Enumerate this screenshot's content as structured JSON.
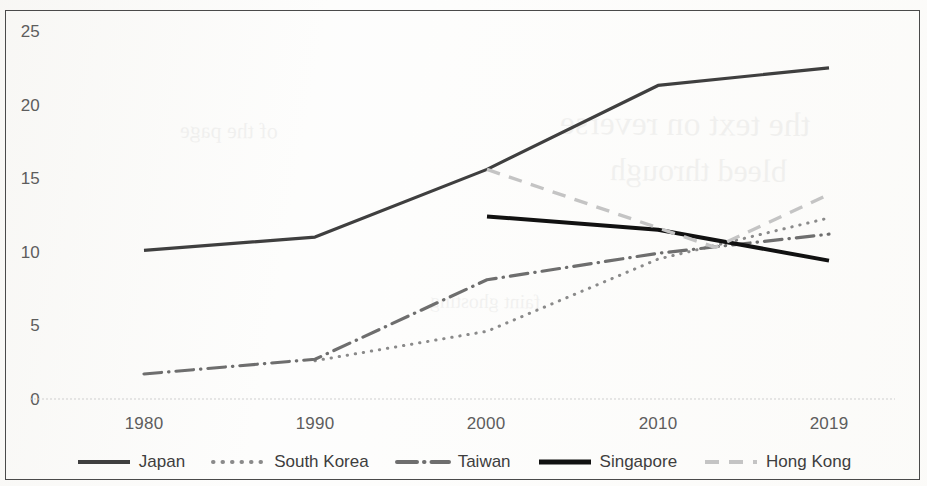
{
  "chart_data": {
    "type": "line",
    "title": "",
    "xlabel": "",
    "ylabel": "",
    "x": [
      1980,
      1990,
      2000,
      2010,
      2019
    ],
    "categories": [
      "1980",
      "1990",
      "2000",
      "2010",
      "2019"
    ],
    "x_tick_labels": [
      "1980",
      "1990",
      "2000",
      "2010",
      "2019"
    ],
    "y_tick_labels": [
      "0",
      "5",
      "10",
      "15",
      "20",
      "25"
    ],
    "y_ticks": [
      0,
      5,
      10,
      15,
      20,
      25
    ],
    "ylim": [
      0,
      25
    ],
    "grid": false,
    "legend_position": "bottom",
    "series": [
      {
        "name": "Japan",
        "style": "solid",
        "color": "#3f3f3f",
        "width": 3.2,
        "x": [
          1980,
          1990,
          2000,
          2010,
          2019
        ],
        "values": [
          10.1,
          11.0,
          15.6,
          21.3,
          22.5
        ]
      },
      {
        "name": "South Korea",
        "style": "dotted",
        "color": "#8a8a8a",
        "width": 3.0,
        "x": [
          1990,
          2000,
          2010,
          2019
        ],
        "values": [
          2.6,
          4.6,
          9.5,
          12.3
        ]
      },
      {
        "name": "Taiwan",
        "style": "dash-dot",
        "color": "#6e6e6e",
        "width": 3.2,
        "x": [
          1980,
          1990,
          2000,
          2010,
          2019
        ],
        "values": [
          1.7,
          2.7,
          8.1,
          9.9,
          11.2
        ]
      },
      {
        "name": "Singapore",
        "style": "solid",
        "color": "#111111",
        "width": 4.0,
        "x": [
          2000,
          2010,
          2019
        ],
        "values": [
          12.4,
          11.5,
          9.4
        ]
      },
      {
        "name": "Hong Kong",
        "style": "dashed",
        "color": "#c4c4c4",
        "width": 3.4,
        "x": [
          2000,
          2013,
          2019
        ],
        "values": [
          15.6,
          10.3,
          13.9
        ]
      }
    ]
  },
  "legend": {
    "items": [
      {
        "label": "Japan"
      },
      {
        "label": "South Korea"
      },
      {
        "label": "Taiwan"
      },
      {
        "label": "Singapore"
      },
      {
        "label": "Hong Kong"
      }
    ]
  },
  "background_bleed": {
    "lines": [
      "the text on reverse",
      "bleed through",
      "of the page",
      "faint ghosting"
    ]
  }
}
